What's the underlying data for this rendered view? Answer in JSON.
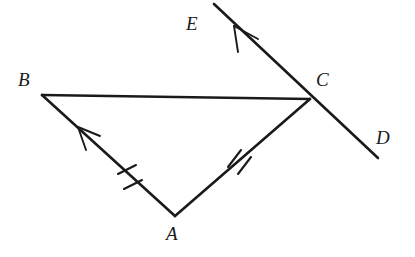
{
  "figure": {
    "type": "geometry-diagram",
    "background_color": "#ffffff",
    "stroke_color": "#1a1a1a",
    "points": {
      "A": {
        "x": 175,
        "y": 216,
        "label": "A",
        "label_x": 166,
        "label_y": 224
      },
      "B": {
        "x": 42,
        "y": 95,
        "label": "B",
        "label_x": 18,
        "label_y": 70
      },
      "C": {
        "x": 310,
        "y": 99,
        "label": "C",
        "label_x": 316,
        "label_y": 70
      },
      "D": {
        "x": 378,
        "y": 158,
        "label": "D",
        "label_x": 376,
        "label_y": 128
      },
      "E": {
        "x": 214,
        "y": 4,
        "label": "E",
        "label_x": 186,
        "label_y": 14
      }
    },
    "segments": [
      {
        "name": "segment-BC",
        "from": "B",
        "to": "C",
        "width": 2.6
      },
      {
        "name": "segment-BA",
        "from": "B",
        "to": "A",
        "width": 2.6
      },
      {
        "name": "segment-AC",
        "from": "A",
        "to": "C",
        "width": 2.6
      },
      {
        "name": "line-ED",
        "from": "E",
        "to": "D",
        "width": 2.6
      }
    ],
    "congruence_ticks": [
      {
        "name": "tick-segment-AB",
        "on": "segment-BA",
        "count": 2,
        "x": 130,
        "y": 178
      },
      {
        "name": "tick-segment-AC",
        "on": "segment-AC",
        "count": 2,
        "x": 238,
        "y": 160
      }
    ],
    "direction_arrows": [
      {
        "name": "arrow-on-BA",
        "on": "segment-BA",
        "x": 86,
        "y": 133,
        "points_toward": "B"
      },
      {
        "name": "arrow-on-EC",
        "on": "line-ED",
        "x": 241,
        "y": 32,
        "points_toward": "E"
      }
    ]
  }
}
